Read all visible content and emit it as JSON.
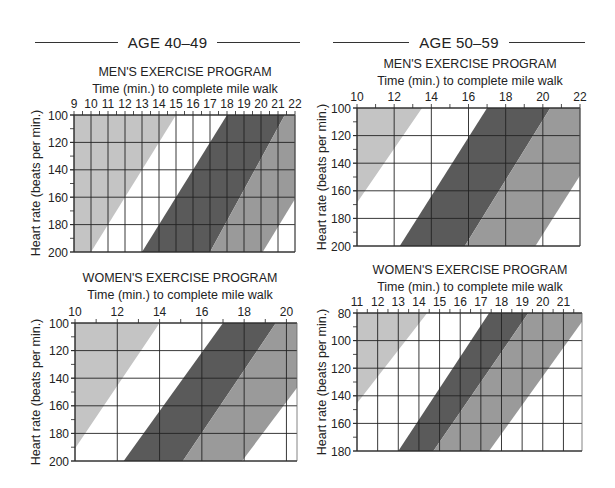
{
  "sections": [
    {
      "label": "AGE 40–49"
    },
    {
      "label": "AGE 50–59"
    }
  ],
  "colors": {
    "light_band": "#c4c4c4",
    "dark_band": "#5a5a5a",
    "medium_band": "#9a9a9a",
    "grid": "#222222",
    "background": "#ffffff"
  },
  "chart_data": [
    {
      "type": "area",
      "section": "AGE 40–49",
      "title": "MEN'S EXERCISE PROGRAM",
      "subtitle": "Time (min.) to complete mile walk",
      "xlabel": "Time (min.) to complete mile walk",
      "ylabel": "Heart rate (beats per min.)",
      "x_ticks": [
        9,
        10,
        11,
        12,
        13,
        14,
        15,
        16,
        17,
        18,
        19,
        20,
        21,
        22
      ],
      "y_ticks": [
        100,
        120,
        140,
        160,
        180,
        200
      ],
      "xlim": [
        9,
        22
      ],
      "ylim": [
        100,
        200
      ],
      "y_inverted": true,
      "grid": true,
      "bands": [
        {
          "name": "light",
          "left_edge": [
            [
              9,
              100
            ],
            [
              9,
              200
            ]
          ],
          "right_edge": [
            [
              15,
              100
            ],
            [
              10,
              200
            ]
          ]
        },
        {
          "name": "dark",
          "left_edge": [
            [
              18,
              100
            ],
            [
              13,
              200
            ]
          ],
          "right_edge": [
            [
              21.4,
              100
            ],
            [
              17,
              200
            ]
          ]
        },
        {
          "name": "medium",
          "left_edge": [
            [
              21.4,
              100
            ],
            [
              17,
              200
            ]
          ],
          "right_edge": [
            [
              25,
              100
            ],
            [
              20.1,
              200
            ]
          ]
        }
      ]
    },
    {
      "type": "area",
      "section": "AGE 50–59",
      "title": "MEN'S EXERCISE PROGRAM",
      "subtitle": "Time (min.) to complete mile walk",
      "xlabel": "Time (min.) to complete mile walk",
      "ylabel": "Heart rate (beats per min.)",
      "x_ticks": [
        10,
        12,
        14,
        16,
        18,
        20,
        22
      ],
      "y_ticks": [
        100,
        120,
        140,
        160,
        180,
        200
      ],
      "xlim": [
        10,
        22
      ],
      "ylim": [
        100,
        200
      ],
      "y_inverted": true,
      "grid": true,
      "bands": [
        {
          "name": "light",
          "left_edge": [
            [
              10,
              100
            ],
            [
              10,
              200
            ]
          ],
          "right_edge": [
            [
              13.5,
              100
            ],
            [
              8.4,
              200
            ]
          ]
        },
        {
          "name": "dark",
          "left_edge": [
            [
              17,
              100
            ],
            [
              12.3,
              200
            ]
          ],
          "right_edge": [
            [
              20.4,
              100
            ],
            [
              15.8,
              200
            ]
          ]
        },
        {
          "name": "medium",
          "left_edge": [
            [
              20.4,
              100
            ],
            [
              15.8,
              200
            ]
          ],
          "right_edge": [
            [
              24.3,
              100
            ],
            [
              19.6,
              200
            ]
          ]
        }
      ]
    },
    {
      "type": "area",
      "section": "AGE 40–49",
      "title": "WOMEN'S EXERCISE PROGRAM",
      "subtitle": "Time (min.) to complete mile walk",
      "xlabel": "Time (min.) to complete mile walk",
      "ylabel": "Heart rate (beats per min.)",
      "x_ticks": [
        10,
        12,
        14,
        16,
        18,
        20
      ],
      "y_ticks": [
        100,
        120,
        140,
        160,
        180,
        200
      ],
      "xlim": [
        10,
        20.5
      ],
      "ylim": [
        100,
        200
      ],
      "y_inverted": true,
      "grid": true,
      "bands": [
        {
          "name": "light",
          "left_edge": [
            [
              10,
              100
            ],
            [
              10,
              200
            ]
          ],
          "right_edge": [
            [
              14,
              100
            ],
            [
              9.6,
              200
            ]
          ]
        },
        {
          "name": "dark",
          "left_edge": [
            [
              17,
              100
            ],
            [
              12.3,
              200
            ]
          ],
          "right_edge": [
            [
              19.5,
              100
            ],
            [
              15.1,
              200
            ]
          ]
        },
        {
          "name": "medium",
          "left_edge": [
            [
              19.5,
              100
            ],
            [
              15.1,
              200
            ]
          ],
          "right_edge": [
            [
              22.8,
              100
            ],
            [
              17.9,
              200
            ]
          ]
        }
      ]
    },
    {
      "type": "area",
      "section": "AGE 50–59",
      "title": "WOMEN'S EXERCISE PROGRAM",
      "subtitle": "Time (min.) to complete mile walk",
      "xlabel": "Time (min.) to complete mile walk",
      "ylabel": "Heart rate (beats per min.)",
      "x_ticks": [
        11,
        12,
        13,
        14,
        15,
        16,
        17,
        18,
        19,
        20,
        21
      ],
      "y_ticks": [
        80,
        100,
        120,
        140,
        160,
        180
      ],
      "xlim": [
        11,
        21.9
      ],
      "ylim": [
        80,
        180
      ],
      "y_inverted": true,
      "grid": true,
      "bands": [
        {
          "name": "light",
          "left_edge": [
            [
              11,
              80
            ],
            [
              11,
              180
            ]
          ],
          "right_edge": [
            [
              14.4,
              80
            ],
            [
              9.2,
              180
            ]
          ]
        },
        {
          "name": "dark",
          "left_edge": [
            [
              17.4,
              80
            ],
            [
              13,
              180
            ]
          ],
          "right_edge": [
            [
              19.3,
              80
            ],
            [
              14.7,
              180
            ]
          ]
        },
        {
          "name": "medium",
          "left_edge": [
            [
              19.3,
              80
            ],
            [
              14.7,
              180
            ]
          ],
          "right_edge": [
            [
              22.2,
              80
            ],
            [
              17.4,
              180
            ]
          ]
        }
      ]
    }
  ]
}
